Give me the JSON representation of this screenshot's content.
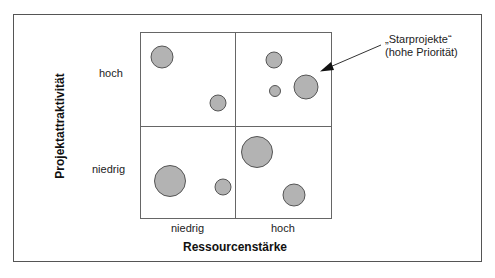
{
  "chart_data": {
    "type": "scatter",
    "subtype": "portfolio-matrix-bubble",
    "title": "",
    "xlabel": "Ressourcenstärke",
    "ylabel": "Projektattraktivität",
    "x_categories": [
      "niedrig",
      "hoch"
    ],
    "y_categories": [
      "niedrig",
      "hoch"
    ],
    "grid": "2x2",
    "quadrants": [
      {
        "x": "niedrig",
        "y": "hoch",
        "bubbles": [
          {
            "cx": 162,
            "cy": 57,
            "r": 11
          },
          {
            "cx": 218,
            "cy": 103,
            "r": 8
          }
        ]
      },
      {
        "x": "hoch",
        "y": "hoch",
        "bubbles": [
          {
            "cx": 274,
            "cy": 60,
            "r": 8
          },
          {
            "cx": 275,
            "cy": 91,
            "r": 5.5
          },
          {
            "cx": 306,
            "cy": 87,
            "r": 12
          }
        ]
      },
      {
        "x": "niedrig",
        "y": "niedrig",
        "bubbles": [
          {
            "cx": 170,
            "cy": 181,
            "r": 15.5
          },
          {
            "cx": 223,
            "cy": 187,
            "r": 8
          }
        ]
      },
      {
        "x": "hoch",
        "y": "niedrig",
        "bubbles": [
          {
            "cx": 257,
            "cy": 152,
            "r": 15.5
          },
          {
            "cx": 294,
            "cy": 195,
            "r": 11
          }
        ]
      }
    ],
    "annotations": [
      {
        "text_line1": "„Starprojekte“",
        "text_line2": "(hohe Priorität)",
        "points_to_quadrant": "hoch/hoch"
      }
    ],
    "colors": {
      "bubble_fill": "#b3b3b3",
      "bubble_stroke": "#555555",
      "grid_line": "#666666"
    }
  },
  "labels": {
    "y_axis_title": "Projektattraktivität",
    "x_axis_title": "Ressourcenstärke",
    "y_high": "hoch",
    "y_low": "niedrig",
    "x_low": "niedrig",
    "x_high": "hoch",
    "annotation_line1": "„Starprojekte“",
    "annotation_line2": "(hohe Priorität)"
  }
}
